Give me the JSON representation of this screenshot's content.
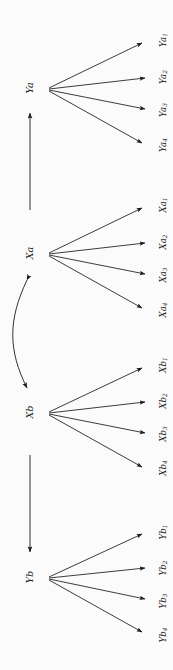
{
  "figure": {
    "type": "path-diagram",
    "orientation": "rotated-90-ccw",
    "background_color": "#fbfbfb",
    "stroke_color": "#1a1a1a"
  },
  "nodes": [
    {
      "id": "Ya",
      "label": "Ya",
      "base": "Y",
      "suffix": "a",
      "x": 29,
      "y": 88,
      "indicators": [
        {
          "label": "Ya",
          "sub": "1",
          "x": 163,
          "y": 40
        },
        {
          "label": "Ya",
          "sub": "2",
          "x": 163,
          "y": 77
        },
        {
          "label": "Ya",
          "sub": "3",
          "x": 163,
          "y": 110
        },
        {
          "label": "Ya",
          "sub": "4",
          "x": 163,
          "y": 145
        }
      ]
    },
    {
      "id": "Xa",
      "label": "Xa",
      "base": "X",
      "suffix": "a",
      "x": 29,
      "y": 253,
      "indicators": [
        {
          "label": "Xa",
          "sub": "1",
          "x": 163,
          "y": 205
        },
        {
          "label": "Xa",
          "sub": "2",
          "x": 163,
          "y": 242
        },
        {
          "label": "Xa",
          "sub": "3",
          "x": 163,
          "y": 275
        },
        {
          "label": "Xa",
          "sub": "4",
          "x": 163,
          "y": 310
        }
      ]
    },
    {
      "id": "Xb",
      "label": "Xb",
      "base": "X",
      "suffix": "b",
      "x": 29,
      "y": 412,
      "indicators": [
        {
          "label": "Xb",
          "sub": "1",
          "x": 163,
          "y": 365
        },
        {
          "label": "Xb",
          "sub": "2",
          "x": 163,
          "y": 401
        },
        {
          "label": "Xb",
          "sub": "3",
          "x": 163,
          "y": 434
        },
        {
          "label": "Xb",
          "sub": "4",
          "x": 163,
          "y": 468
        }
      ]
    },
    {
      "id": "Yb",
      "label": "Yb",
      "base": "Y",
      "suffix": "b",
      "x": 29,
      "y": 577,
      "indicators": [
        {
          "label": "Yb",
          "sub": "1",
          "x": 163,
          "y": 532
        },
        {
          "label": "Yb",
          "sub": "2",
          "x": 163,
          "y": 568
        },
        {
          "label": "Yb",
          "sub": "3",
          "x": 163,
          "y": 601
        },
        {
          "label": "Yb",
          "sub": "4",
          "x": 163,
          "y": 635
        }
      ]
    }
  ],
  "edges": [
    {
      "id": "Xa-to-Ya",
      "from": "Xa",
      "to": "Ya",
      "style": "straight",
      "heads": "single"
    },
    {
      "id": "Xa-to-Xb",
      "from": "Xa",
      "to": "Xb",
      "style": "curved",
      "heads": "double"
    },
    {
      "id": "Xb-to-Yb",
      "from": "Xb",
      "to": "Yb",
      "style": "straight",
      "heads": "single"
    }
  ]
}
